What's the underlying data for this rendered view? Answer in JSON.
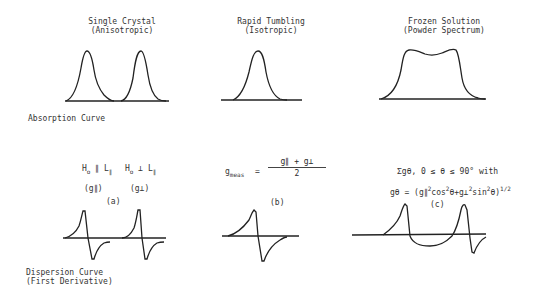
{
  "columns": [
    {
      "title_line1": "Single Crystal",
      "title_line2": "(Anisotropic)"
    },
    {
      "title_line1": "Rapid Tumbling",
      "title_line2": "(Isotropic)"
    },
    {
      "title_line1": "Frozen Solution",
      "title_line2": "(Powder Spectrum)"
    }
  ],
  "row_labels": {
    "absorption": "Absorption Curve",
    "dispersion_line1": "Dispersion Curve",
    "dispersion_line2": "(First Derivative)"
  },
  "panel_a": {
    "cond1": {
      "H": "H",
      "sub": "o",
      "rel": "∥",
      "L": "L",
      "Lsub": "∥"
    },
    "cond2": {
      "H": "H",
      "sub": "o",
      "rel": "⊥",
      "L": "L",
      "Lsub": "∥"
    },
    "g1": "(g∥)",
    "g2": "(g⊥)",
    "label": "(a)"
  },
  "panel_b": {
    "lhs": "g",
    "lhs_sub": "meas",
    "eq": "=",
    "numerator": "g∥ + g⊥",
    "denominator": "2",
    "label": "(b)"
  },
  "panel_c": {
    "line1": "Σgθ, 0 ≤ θ ≤ 90° with",
    "line2_a": "gθ = (g∥",
    "line2_sup1": "2",
    "line2_b": "cos",
    "line2_sup2": "2",
    "line2_c": "θ+g⊥",
    "line2_sup3": "2",
    "line2_d": "sin",
    "line2_sup4": "2",
    "line2_e": "θ)",
    "line2_sup5": "1/2",
    "label": "(c)"
  }
}
